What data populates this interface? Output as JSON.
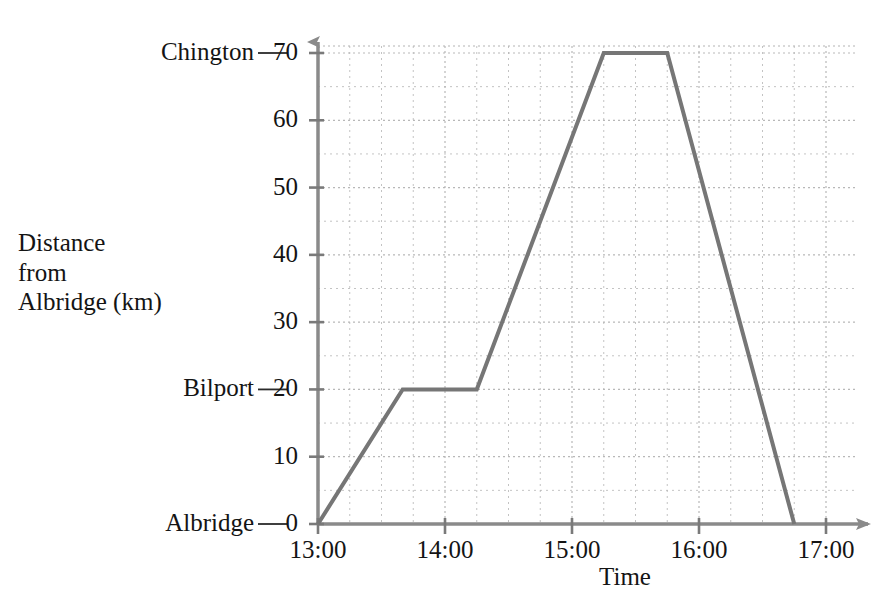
{
  "chart_data": {
    "type": "line",
    "title": "",
    "xlabel": "Time",
    "ylabel": "Distance from Albridge (km)",
    "ylabel_lines": [
      "Distance",
      "from",
      "Albridge (km)"
    ],
    "xlim": [
      "13:00",
      "17:00"
    ],
    "ylim": [
      0,
      70
    ],
    "y_ticks": [
      0,
      10,
      20,
      30,
      40,
      50,
      60,
      70
    ],
    "y_tick_labels": [
      "0",
      "10",
      "20",
      "30",
      "40",
      "50",
      "60",
      "70"
    ],
    "x_ticks": [
      "13:00",
      "14:00",
      "15:00",
      "16:00",
      "17:00"
    ],
    "x_tick_labels": [
      "13:00",
      "14:00",
      "15:00",
      "16:00",
      "17:00"
    ],
    "x_minor_step_minutes": 15,
    "y_minor_step": 5,
    "grid": true,
    "grid_style": "dotted",
    "legend": "none",
    "place_labels": [
      {
        "name": "Chington",
        "value": 70
      },
      {
        "name": "Bilport",
        "value": 20
      },
      {
        "name": "Albridge",
        "value": 0
      }
    ],
    "series": [
      {
        "name": "Journey",
        "points": [
          {
            "x": "13:00",
            "y": 0
          },
          {
            "x": "13:40",
            "y": 20
          },
          {
            "x": "14:15",
            "y": 20
          },
          {
            "x": "15:15",
            "y": 70
          },
          {
            "x": "15:45",
            "y": 70
          },
          {
            "x": "16:45",
            "y": 0
          }
        ]
      }
    ]
  },
  "colors": {
    "line": "#767676",
    "axis": "#7a7a7a",
    "grid": "#b4b4b4",
    "text": "#141414",
    "background": "#ffffff"
  }
}
